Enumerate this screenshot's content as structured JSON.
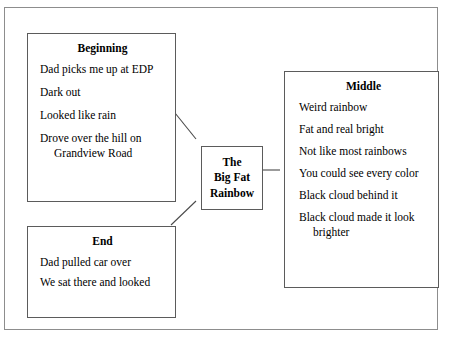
{
  "diagram": {
    "type": "story-map-graphic-organizer",
    "center": {
      "name": "center-node",
      "lines": [
        "The",
        "Big Fat",
        "Rainbow"
      ],
      "line1": "The",
      "line2": "Big Fat",
      "line3": "Rainbow"
    },
    "nodes": [
      {
        "id": "beginning",
        "title": "Beginning",
        "items": [
          "Dad picks me up at EDP",
          "Dark out",
          "Looked like rain",
          "Drove over the hill on Grandview Road"
        ]
      },
      {
        "id": "middle",
        "title": "Middle",
        "items": [
          "Weird rainbow",
          "Fat and real bright",
          "Not like most rainbows",
          "You could see every color",
          "Black cloud behind it",
          "Black cloud made it look brighter"
        ]
      },
      {
        "id": "end",
        "title": "End",
        "items": [
          "Dad pulled car over",
          "We sat there and looked"
        ]
      }
    ],
    "connectors": [
      {
        "name": "connector-beginning-to-center",
        "from": "beginning",
        "to": "center"
      },
      {
        "name": "connector-middle-to-center",
        "from": "center",
        "to": "middle"
      },
      {
        "name": "connector-end-to-center",
        "from": "end",
        "to": "center"
      }
    ],
    "colors": {
      "background": "#ffffff",
      "text": "#000000",
      "box_border": "#5b5b5b",
      "frame_border": "#8d8d8d",
      "connector_line": "#4a4a4a"
    }
  }
}
